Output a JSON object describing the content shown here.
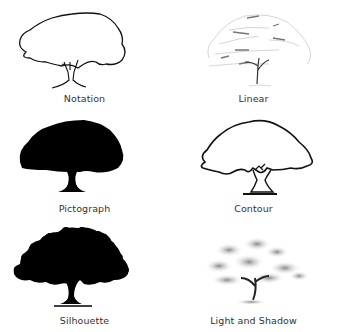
{
  "figure": {
    "items": [
      {
        "label": "Notation",
        "style": "outline-thin"
      },
      {
        "label": "Linear",
        "style": "sketch-light"
      },
      {
        "label": "Pictograph",
        "style": "solid-smooth"
      },
      {
        "label": "Contour",
        "style": "outline-thick"
      },
      {
        "label": "Silhouette",
        "style": "solid-textured"
      },
      {
        "label": "Light and Shadow",
        "style": "shaded"
      }
    ]
  }
}
